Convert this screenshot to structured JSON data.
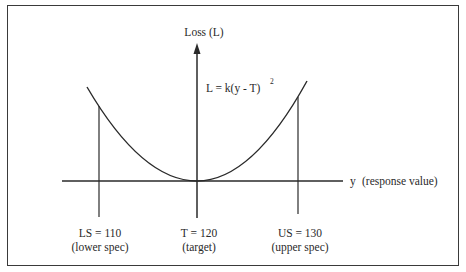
{
  "diagram": {
    "type": "quadratic-loss-function",
    "colors": {
      "line": "#2a2a2a",
      "border": "#3a3a3a",
      "background": "#ffffff"
    },
    "y_axis": {
      "label": "Loss (L)"
    },
    "x_axis": {
      "symbol": "y",
      "label": "(response value)"
    },
    "formula": {
      "text": "L = k(y - T)",
      "superscript": "2"
    },
    "markers": [
      {
        "id": "ls",
        "value_label": "LS = 110",
        "desc": "(lower spec)"
      },
      {
        "id": "t",
        "value_label": "T = 120",
        "desc": "(target)"
      },
      {
        "id": "us",
        "value_label": "US = 130",
        "desc": "(upper spec)"
      }
    ]
  }
}
